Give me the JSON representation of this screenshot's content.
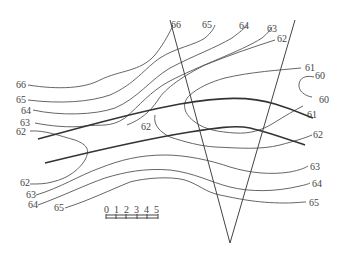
{
  "diagram": {
    "type": "contour-map",
    "contour_labels": {
      "top": [
        "66",
        "65",
        "64",
        "63",
        "62"
      ],
      "left": [
        "66",
        "65",
        "64",
        "63",
        "62"
      ],
      "left_lower": [
        "62",
        "63",
        "64",
        "65"
      ],
      "right": [
        "61",
        "60",
        "60",
        "61",
        "62",
        "63",
        "64",
        "65"
      ],
      "center": "62"
    },
    "scale": {
      "ticks": [
        "0",
        "1",
        "2",
        "3",
        "4",
        "5"
      ]
    },
    "colors": {
      "contour": "#555555",
      "line": "#333333",
      "background": "#ffffff"
    }
  },
  "labels": {
    "t66": "66",
    "t65": "65",
    "t64": "64",
    "t63": "63",
    "t62": "62",
    "l66": "66",
    "l65": "65",
    "l64": "64",
    "l63": "63",
    "l62": "62",
    "b62": "62",
    "b63": "63",
    "b64": "64",
    "b65": "65",
    "r61a": "61",
    "r60a": "60",
    "r60b": "60",
    "r61b": "61",
    "r62": "62",
    "r63": "63",
    "r64": "64",
    "r65": "65",
    "c62": "62",
    "s0": "0",
    "s1": "1",
    "s2": "2",
    "s3": "3",
    "s4": "4",
    "s5": "5"
  }
}
